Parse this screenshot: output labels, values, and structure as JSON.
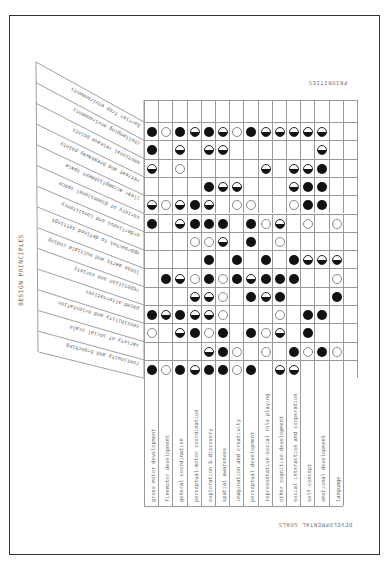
{
  "side_title": "DESIGN PRINCIPLES",
  "priorities_label": "PRIORITIES",
  "goals_label": "DEVELOPMENTAL GOALS",
  "legend_codes": {
    "F": "full circle (high priority)",
    "H": "half circle (medium priority)",
    "O": "open circle (low priority)"
  },
  "columns": [
    "gross motor development",
    "finemotor development",
    "general coordination",
    "perceptual-motor coordination",
    "exploration & discovery",
    "spatial awareness",
    "imagination and creativity",
    "perceptual development",
    "representation-social role playing",
    "other cognitive development",
    "social interaction and cooperation",
    "self-concept",
    "emotional development",
    "language"
  ],
  "rows": [
    {
      "label": "barrier free environments",
      "cells": [
        "F",
        "O",
        "F",
        "H",
        "F",
        "H",
        "O",
        "F",
        "H",
        "H",
        "H",
        "H",
        "H",
        ""
      ]
    },
    {
      "label": "challenging environments",
      "cells": [
        "F",
        "",
        "H",
        "",
        "H",
        "H",
        "",
        "",
        "",
        "",
        "",
        "",
        "H",
        ""
      ]
    },
    {
      "label": "emotional release points",
      "cells": [
        "H",
        "",
        "O",
        "",
        "",
        "",
        "",
        "",
        "H",
        "",
        "H",
        "H",
        "F",
        ""
      ]
    },
    {
      "label": "retreat and breakaway points",
      "cells": [
        "",
        "",
        "",
        "",
        "F",
        "H",
        "H",
        "",
        "",
        "",
        "H",
        "F",
        "F",
        ""
      ]
    },
    {
      "label": "clear accomplishment space",
      "cells": [
        "H",
        "O",
        "H",
        "F",
        "H",
        "",
        "O",
        "O",
        "",
        "",
        "O",
        "F",
        "F",
        ""
      ]
    },
    {
      "label": "variety of dimensional space",
      "cells": [
        "F",
        "",
        "H",
        "F",
        "F",
        "F",
        "",
        "F",
        "O",
        "H",
        "",
        "O",
        "",
        "O"
      ]
    },
    {
      "label": "orderliness and consistency",
      "cells": [
        "",
        "",
        "",
        "O",
        "O",
        "H",
        "",
        "F",
        "",
        "O",
        "",
        "",
        "",
        ""
      ]
    },
    {
      "label": "approaches to defined settings",
      "cells": [
        "",
        "",
        "",
        "",
        "F",
        "",
        "F",
        "",
        "F",
        "",
        "F",
        "H",
        "H",
        "H"
      ]
    },
    {
      "label": "loose parts and multiple coding",
      "cells": [
        "",
        "F",
        "H",
        "O",
        "F",
        "O",
        "F",
        "H",
        "F",
        "F",
        "F",
        "",
        "",
        "O"
      ]
    },
    {
      "label": "repetition and variety",
      "cells": [
        "",
        "",
        "",
        "H",
        "H",
        "O",
        "",
        "F",
        "H",
        "F",
        "",
        "",
        "",
        "F"
      ]
    },
    {
      "label": "paced alternatives",
      "cells": [
        "F",
        "H",
        "F",
        "H",
        "H",
        "O",
        "",
        "",
        "",
        "O",
        "",
        "F",
        "F",
        ""
      ]
    },
    {
      "label": "sensibility and orientation",
      "cells": [
        "O",
        "",
        "H",
        "F",
        "O",
        "F",
        "",
        "F",
        "O",
        "H",
        "",
        "F",
        "",
        ""
      ]
    },
    {
      "label": "variety of social scale",
      "cells": [
        "",
        "",
        "",
        "",
        "H",
        "F",
        "O",
        "",
        "O",
        "",
        "F",
        "O",
        "F",
        "O"
      ]
    },
    {
      "label": "continuity and branching",
      "cells": [
        "F",
        "O",
        "F",
        "H",
        "F",
        "F",
        "O",
        "F",
        "",
        "H",
        "H",
        "",
        "",
        ""
      ]
    }
  ]
}
